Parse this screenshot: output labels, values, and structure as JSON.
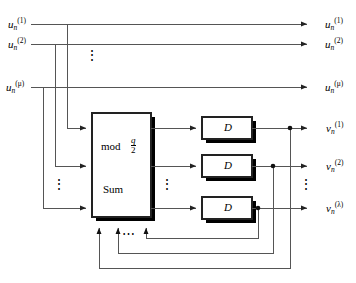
{
  "diagram": {
    "colors": {
      "line": "#444444",
      "shadow": "#000000",
      "fill": "#ffffff",
      "text": "#000000"
    },
    "inputs": [
      {
        "name": "input-1",
        "base": "u",
        "sub": "n",
        "sup": "(1)"
      },
      {
        "name": "input-2",
        "base": "u",
        "sub": "n",
        "sup": "(2)"
      },
      {
        "name": "input-mu",
        "base": "u",
        "sub": "n",
        "sup": "(μ)"
      }
    ],
    "passthrough_outputs": [
      {
        "name": "passthrough-1",
        "base": "u",
        "sub": "n",
        "sup": "(1)"
      },
      {
        "name": "passthrough-2",
        "base": "u",
        "sub": "n",
        "sup": "(2)"
      },
      {
        "name": "passthrough-mu",
        "base": "u",
        "sub": "n",
        "sup": "(μ)"
      }
    ],
    "outputs": [
      {
        "name": "output-1",
        "base": "v",
        "sub": "n",
        "sup": "(1)"
      },
      {
        "name": "output-2",
        "base": "v",
        "sub": "n",
        "sup": "(2)"
      },
      {
        "name": "output-lambda",
        "base": "v",
        "sub": "n",
        "sup": "(λ)"
      }
    ],
    "sum_block": {
      "mod_label": "mod",
      "fraction_numerator": "q",
      "fraction_denominator": "2",
      "sum_label": "Sum"
    },
    "delay_blocks": [
      {
        "name": "delay-block-1",
        "label": "D"
      },
      {
        "name": "delay-block-2",
        "label": "D"
      },
      {
        "name": "delay-block-3",
        "label": "D"
      }
    ],
    "ellipses": [
      {
        "name": "ellipsis-inputs",
        "glyph": "⋮"
      },
      {
        "name": "ellipsis-sum-inputs",
        "glyph": "⋮"
      },
      {
        "name": "ellipsis-sum-outputs",
        "glyph": "⋮"
      },
      {
        "name": "ellipsis-delay-blocks",
        "glyph": "⋮"
      },
      {
        "name": "ellipsis-outputs",
        "glyph": "⋮"
      },
      {
        "name": "ellipsis-feedback",
        "glyph": "⋯"
      }
    ]
  }
}
